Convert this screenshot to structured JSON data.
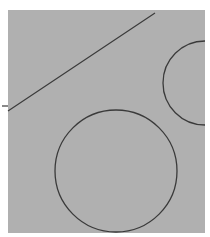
{
  "figure": {
    "caption_fragment": "",
    "background_color": "#b0b0b0",
    "stroke_color": "#3a3a3a",
    "line": {
      "x1": 2,
      "y1": 106,
      "x2": 155,
      "y2": 13
    },
    "right_arc": {
      "cx": 205,
      "cy": 83,
      "r": 42
    },
    "circle": {
      "cx": 116,
      "cy": 171,
      "r": 61
    }
  }
}
